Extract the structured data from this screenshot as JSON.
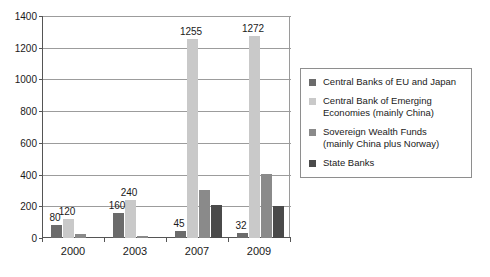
{
  "chart_data": {
    "type": "bar",
    "title": "",
    "subtitle": "",
    "xlabel": "",
    "ylabel": "",
    "categories": [
      "2000",
      "2003",
      "2007",
      "2009"
    ],
    "ylim": [
      0,
      1400
    ],
    "yticks": [
      0,
      200,
      400,
      600,
      800,
      1000,
      1200,
      1400
    ],
    "grid": true,
    "legend_position": "right",
    "series": [
      {
        "name": "Central Banks of EU and Japan",
        "legend_label": "Central Banks of EU and Japan",
        "color": "#6b6b6b",
        "values": [
          80,
          160,
          45,
          32
        ],
        "data_labels": [
          "80",
          "160",
          "45",
          "32"
        ]
      },
      {
        "name": "Central Bank of Emerging Economies (mainly China)",
        "legend_label": "Central Bank of Emerging\nEconomies (mainly China)",
        "color": "#c9c9c9",
        "values": [
          120,
          240,
          1255,
          1272
        ],
        "data_labels": [
          "120",
          "240",
          "1255",
          "1272"
        ]
      },
      {
        "name": "Sovereign Wealth Funds (mainly China plus Norway)",
        "legend_label": "Sovereign Wealth Funds\n(mainly China plus Norway)",
        "color": "#8a8a8a",
        "values": [
          25,
          10,
          305,
          405
        ],
        "data_labels": [
          "",
          "",
          "",
          ""
        ]
      },
      {
        "name": "State Banks",
        "legend_label": "State Banks",
        "color": "#4a4a4a",
        "values": [
          0,
          0,
          210,
          205
        ],
        "data_labels": [
          "",
          "",
          "",
          ""
        ]
      }
    ]
  },
  "colors": {
    "background": "#ffffff",
    "axis": "#555555",
    "gridline": "#9c9c9c",
    "legend_border": "#8e8e8e",
    "text": "#1a1a1a"
  }
}
